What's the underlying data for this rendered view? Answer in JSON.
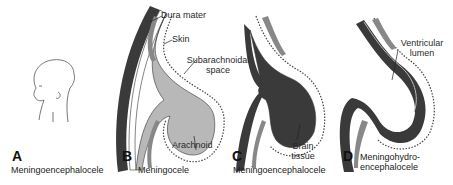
{
  "panels": [
    {
      "letter": "A",
      "caption": "Meningoencephalocele"
    },
    {
      "letter": "B",
      "caption": "Meningocele"
    },
    {
      "letter": "C",
      "caption": "Meningoencephalocele"
    },
    {
      "letter": "D",
      "caption": "Meningohydro-",
      "caption2": "encephalocele"
    }
  ],
  "labels": {
    "dura_mater": "Dura mater",
    "skin": "Skin",
    "subarachnoidal_1": "Subarachnoidal",
    "subarachnoidal_2": "space",
    "arachnoid": "Arachnoid",
    "brain_1": "Brain",
    "brain_2": "tissue",
    "ventricular_1": "Ventricular",
    "ventricular_2": "lumen"
  },
  "colors": {
    "brain": "#3a3a3a",
    "csf": "#b8b8b8",
    "bone": "#8a8a8a",
    "membrane": "#ffffff",
    "line": "#222222"
  }
}
